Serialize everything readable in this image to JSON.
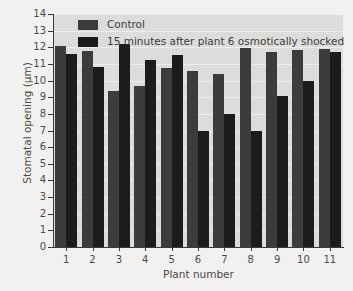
{
  "chart_data": {
    "type": "bar",
    "title": "",
    "xlabel": "Plant number",
    "ylabel": "Stomatal opening (µm)",
    "categories": [
      "1",
      "2",
      "3",
      "4",
      "5",
      "6",
      "7",
      "8",
      "9",
      "10",
      "11"
    ],
    "series": [
      {
        "name": "Control",
        "color": "#3c3c3c",
        "values": [
          12.05,
          11.75,
          9.4,
          9.7,
          10.75,
          10.6,
          10.4,
          11.95,
          11.7,
          11.85,
          11.9
        ]
      },
      {
        "name": "15 minutes after plant 6 osmotically shocked",
        "color": "#1c1c1c",
        "values": [
          11.6,
          10.8,
          12.2,
          11.25,
          11.55,
          7.0,
          8.0,
          6.95,
          9.05,
          10.0,
          11.7
        ]
      }
    ],
    "ylim": [
      0,
      14
    ],
    "ytick_labels": [
      "0",
      "1",
      "2",
      "3",
      "4",
      "5",
      "6",
      "7",
      "8",
      "9",
      "10",
      "11",
      "12",
      "13",
      "14"
    ],
    "ytick_values": [
      0,
      1,
      2,
      3,
      4,
      5,
      6,
      7,
      8,
      9,
      10,
      11,
      12,
      13,
      14
    ],
    "grid": true,
    "legend_position": "top-left",
    "legend": [
      {
        "label": "Control",
        "color": "#3c3c3c"
      },
      {
        "label": "15 minutes after plant 6 osmotically shocked",
        "color": "#1c1c1c"
      }
    ],
    "plot_background": "#dcdcda",
    "figure_background": "#f2f1ef",
    "axis_color": "#3a3a3a"
  }
}
